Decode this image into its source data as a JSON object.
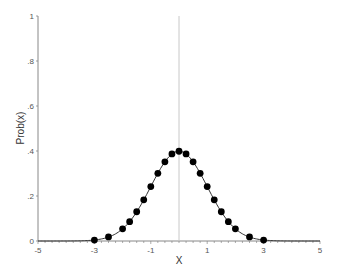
{
  "chart_data": {
    "type": "line",
    "title": "",
    "xlabel": "X",
    "ylabel": "Prob(x)",
    "xlim": [
      -5,
      5
    ],
    "ylim": [
      0,
      1
    ],
    "xticks": [
      -5,
      -3,
      -1,
      1,
      3,
      5
    ],
    "xtick_labels": [
      "-5",
      "-3",
      "-1",
      "1",
      "3",
      "5"
    ],
    "yticks": [
      0,
      0.2,
      0.4,
      0.6,
      0.8,
      1
    ],
    "ytick_labels": [
      "0",
      ".2",
      ".4",
      ".6",
      ".8",
      "1"
    ],
    "grid": false,
    "reference_line": {
      "orientation": "vertical",
      "x": 0,
      "color": "#c8c8c8"
    },
    "series": [
      {
        "name": "Normal density",
        "markers": true,
        "x": [
          -3,
          -2.5,
          -2,
          -1.75,
          -1.5,
          -1.25,
          -1,
          -0.75,
          -0.5,
          -0.25,
          0,
          0.25,
          0.5,
          0.75,
          1,
          1.25,
          1.5,
          1.75,
          2,
          2.5,
          3
        ],
        "y": [
          0.004,
          0.018,
          0.054,
          0.086,
          0.13,
          0.183,
          0.242,
          0.301,
          0.352,
          0.387,
          0.399,
          0.387,
          0.352,
          0.301,
          0.242,
          0.183,
          0.13,
          0.086,
          0.054,
          0.018,
          0.004
        ]
      }
    ]
  }
}
